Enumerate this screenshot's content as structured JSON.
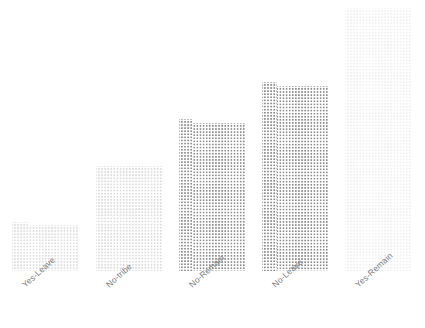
{
  "chart_data": {
    "type": "bar",
    "title": "",
    "subtitle": "",
    "xlabel": "",
    "ylabel": "",
    "categories": [
      "Yes-Leave",
      "No-tribe",
      "No-Remain",
      "No-Leave",
      "Yes-Remain"
    ],
    "values": [
      46,
      105,
      148,
      185,
      263
    ],
    "ylim": [
      0,
      271
    ],
    "grid": false,
    "legend": "none",
    "axis_visible": false,
    "tick_labels_rotated_deg": -42,
    "bar_fill_pattern": "dotted-crosshatch",
    "bars": [
      {
        "label": "Yes-Leave",
        "value": 46,
        "color": "#dedede",
        "x_left_px": 12,
        "width_px": 66,
        "height_px": 46,
        "has_left_step": true,
        "left_step_extra_px": 3,
        "left_step_width_px": 16
      },
      {
        "label": "No-tribe",
        "value": 105,
        "color": "#dcdcdc",
        "x_left_px": 96,
        "width_px": 66,
        "height_px": 105,
        "has_left_step": false,
        "left_step_extra_px": 0,
        "left_step_width_px": 0
      },
      {
        "label": "No-Remain",
        "value": 148,
        "color": "#8d8d8d",
        "x_left_px": 179,
        "width_px": 66,
        "height_px": 148,
        "has_left_step": true,
        "left_step_extra_px": 4,
        "left_step_width_px": 14
      },
      {
        "label": "No-Leave",
        "value": 185,
        "color": "#8a8a8a",
        "x_left_px": 262,
        "width_px": 66,
        "height_px": 185,
        "has_left_step": true,
        "left_step_extra_px": 4,
        "left_step_width_px": 15
      },
      {
        "label": "Yes-Remain",
        "value": 263,
        "color": "#f0f0f0",
        "x_left_px": 345,
        "width_px": 67,
        "height_px": 263,
        "has_left_step": false,
        "left_step_extra_px": 0,
        "left_step_width_px": 0
      }
    ]
  },
  "colors": {
    "background": "#ffffff",
    "tick_label": "#7d7d7d",
    "bar_light": "#dedede",
    "bar_mid": "#8a8a8a",
    "bar_lightest": "#f0f0f0"
  }
}
